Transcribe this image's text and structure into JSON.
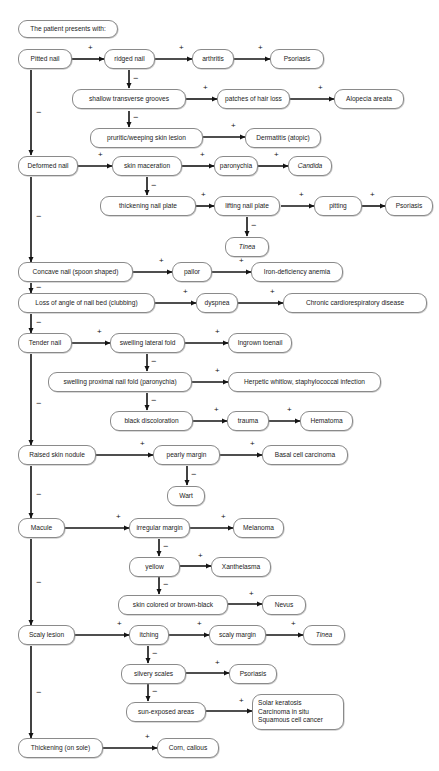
{
  "diagram": {
    "type": "decision-tree-flowchart",
    "root_label": "The patient presents with:",
    "edge_labels": {
      "positive": "+",
      "negative": "−"
    },
    "colors": {
      "background": "#ffffff",
      "node_border": "#8a8a8a",
      "node_fill": "#ffffff",
      "text": "#1b1b1b",
      "arrow": "#141414"
    },
    "nodes": {
      "header": "The patient presents with:",
      "pitted_nail": "Pitted nail",
      "ridged_nail": "ridged nail",
      "arthritis": "arthritis",
      "psoriasis_1": "Psoriasis",
      "shallow_transverse_grooves": "shallow transverse grooves",
      "patches_of_hair_loss": "patches of hair loss",
      "alopecia_areata": "Alopecia areata",
      "pruritic_weeping_skin_lesion": "pruritic/weeping skin lesion",
      "dermatitis_atopic": "Dermatitis (atopic)",
      "deformed_nail": "Deformed nail",
      "skin_maceration": "skin maceration",
      "paronychia": "paronychia",
      "candida": "Candida",
      "thickening_nail_plate": "thickening nail plate",
      "lifting_nail_plate": "lifting nail plate",
      "pitting": "pitting",
      "psoriasis_2": "Psoriasis",
      "tinea_1": "Tinea",
      "concave_nail": "Concave nail (spoon shaped)",
      "pallor": "pallor",
      "iron_deficiency_anemia": "Iron-deficiency anemia",
      "clubbing": "Loss of angle of nail bed (clubbing)",
      "dyspnea": "dyspnea",
      "chronic_cardioresp": "Chronic cardiorespiratory disease",
      "tender_nail": "Tender nail",
      "swelling_lateral_fold": "swelling lateral fold",
      "ingrown_toenail": "Ingrown toenail",
      "swelling_proximal_nail_fold": "swelling proximal nail fold (paronychia)",
      "herpetic_whitlow": "Herpetic whitlow, staphylococcal infection",
      "black_discoloration": "black discoloration",
      "trauma": "trauma",
      "hematoma": "Hematoma",
      "raised_skin_nodule": "Raised skin nodule",
      "pearly_margin": "pearly margin",
      "basal_cell_carcinoma": "Basal cell carcinoma",
      "wart": "Wart",
      "macule": "Macule",
      "irregular_margin": "irregular margin",
      "melanoma": "Melanoma",
      "yellow": "yellow",
      "xanthelasma": "Xanthelasma",
      "skin_colored_or_brown_black": "skin colored or brown-black",
      "nevus": "Nevus",
      "scaly_lesion": "Scaly lesion",
      "itching": "itching",
      "scaly_margin": "scaly margin",
      "tinea_2": "Tinea",
      "silvery_scales": "silvery scales",
      "psoriasis_3": "Psoriasis",
      "sun_exposed_areas": "sun-exposed areas",
      "solar_group_line1": "Solar keratosis",
      "solar_group_line2": "Carcinoma in situ",
      "solar_group_line3": "Squamous cell cancer",
      "thickening_on_sole": "Thickening (on sole)",
      "corn_callous": "Corn, callous"
    },
    "signs": {
      "s01": "+",
      "s02": "+",
      "s03": "+",
      "s04": "−",
      "s05": "+",
      "s06": "+",
      "s07": "−",
      "s08": "+",
      "s09": "−",
      "s10": "+",
      "s11": "+",
      "s12": "+",
      "s13": "−",
      "s14": "+",
      "s15": "+",
      "s16": "+",
      "s17": "−",
      "s18": "−",
      "s19": "+",
      "s20": "+",
      "s21": "−",
      "s22": "+",
      "s23": "+",
      "s24": "−",
      "s25": "+",
      "s26": "+",
      "s27": "−",
      "s28": "+",
      "s29": "−",
      "s30": "+",
      "s31": "+",
      "s32": "−",
      "s33": "+",
      "s34": "+",
      "s35": "−",
      "s36": "−",
      "s37": "+",
      "s38": "+",
      "s39": "−",
      "s40": "+",
      "s41": "−",
      "s42": "+",
      "s43": "−",
      "s44": "+",
      "s45": "+",
      "s46": "+",
      "s47": "−",
      "s48": "+",
      "s49": "−",
      "s50": "+",
      "s51": "−",
      "s52": "+"
    }
  }
}
